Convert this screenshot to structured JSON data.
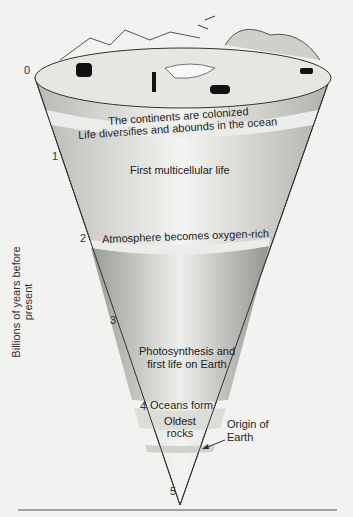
{
  "diagram": {
    "axis_label": "Billions of years before present",
    "ticks": [
      "0",
      "1",
      "2",
      "3",
      "4",
      "5"
    ],
    "events": [
      {
        "label": "The continents are colonized",
        "age": "~0.5"
      },
      {
        "label": "Life diversifies and abounds in the ocean",
        "age": "~0.55"
      },
      {
        "label": "First multicellular life",
        "age": "~1.2"
      },
      {
        "label": "Atmosphere becomes oxygen-rich",
        "age": "~2.2"
      },
      {
        "label": "Photosynthesis and first life on Earth",
        "age": "~3.5"
      },
      {
        "label": "Oceans form",
        "age": "~4.0"
      },
      {
        "label": "Oldest rocks",
        "age": "~4.2"
      }
    ],
    "annotation": {
      "line1": "Origin of",
      "line2": "Earth"
    },
    "colors": {
      "background": "#f2f2f0",
      "cone_light": "#e0e0dc",
      "cone_mid": "#c8c8c4",
      "cone_dark": "#a8a8a4",
      "band": "#ececea"
    }
  }
}
